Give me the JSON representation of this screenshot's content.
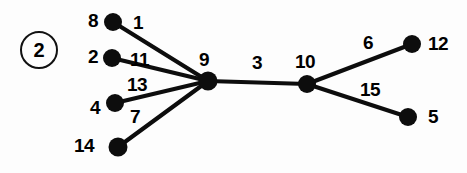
{
  "figure": {
    "label": "2",
    "marker_shape": "circled-number",
    "x": 20,
    "y": 31
  },
  "style": {
    "ink_color": "#0d0d0d",
    "background_color": "#fdfdfd",
    "edge_width": 4.2,
    "node_radius": 8.5
  },
  "chart_data": {
    "type": "diagram",
    "subtype": "weighted-tree-graph",
    "title": "",
    "nodes": [
      {
        "id": "8",
        "label": "8",
        "x": 113,
        "y": 22,
        "r": 9,
        "label_x": 88,
        "label_y": 11,
        "label_pos": "left"
      },
      {
        "id": "2",
        "label": "2",
        "x": 112,
        "y": 58,
        "r": 9,
        "label_x": 88,
        "label_y": 47,
        "label_pos": "left"
      },
      {
        "id": "4",
        "label": "4",
        "x": 115,
        "y": 103,
        "r": 9,
        "label_x": 90,
        "label_y": 98,
        "label_pos": "left"
      },
      {
        "id": "14",
        "label": "14",
        "x": 118,
        "y": 147,
        "r": 9.5,
        "label_x": 74,
        "label_y": 136,
        "label_pos": "left"
      },
      {
        "id": "9",
        "label": "9",
        "x": 208,
        "y": 81,
        "r": 9.5,
        "label_x": 199,
        "label_y": 50,
        "label_pos": "above"
      },
      {
        "id": "10",
        "label": "10",
        "x": 307,
        "y": 84,
        "r": 9,
        "label_x": 295,
        "label_y": 52,
        "label_pos": "above"
      },
      {
        "id": "12",
        "label": "12",
        "x": 412,
        "y": 44,
        "r": 9,
        "label_x": 428,
        "label_y": 34,
        "label_pos": "right"
      },
      {
        "id": "5",
        "label": "5",
        "x": 408,
        "y": 117,
        "r": 9,
        "label_x": 428,
        "label_y": 107,
        "label_pos": "right"
      }
    ],
    "edges": [
      {
        "source": "8",
        "target": "9",
        "weight": "1",
        "label_x": 133,
        "label_y": 13
      },
      {
        "source": "2",
        "target": "9",
        "weight": "11",
        "label_x": 130,
        "label_y": 50
      },
      {
        "source": "4",
        "target": "9",
        "weight": "13",
        "label_x": 127,
        "label_y": 75
      },
      {
        "source": "14",
        "target": "9",
        "weight": "7",
        "label_x": 130,
        "label_y": 107
      },
      {
        "source": "9",
        "target": "10",
        "weight": "3",
        "label_x": 252,
        "label_y": 53
      },
      {
        "source": "10",
        "target": "12",
        "weight": "6",
        "label_x": 363,
        "label_y": 33
      },
      {
        "source": "10",
        "target": "5",
        "weight": "15",
        "label_x": 360,
        "label_y": 80
      }
    ]
  }
}
